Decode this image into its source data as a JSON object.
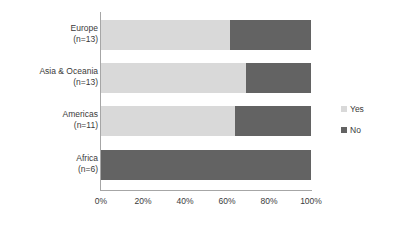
{
  "chart_data": {
    "type": "bar",
    "orientation": "horizontal",
    "stacked": true,
    "normalized": true,
    "title": "",
    "xlabel": "",
    "ylabel": "",
    "categories": [
      "Europe\n(n=13)",
      "Asia & Oceania\n(n=13)",
      "Americas\n(n=11)",
      "Africa\n(n=6)"
    ],
    "category_rows": [
      {
        "name": "Europe",
        "count_label": "(n=13)",
        "n": 13,
        "yes_pct": 61.5,
        "no_pct": 38.5
      },
      {
        "name": "Asia & Oceania",
        "count_label": "(n=13)",
        "n": 13,
        "yes_pct": 69.2,
        "no_pct": 30.8
      },
      {
        "name": "Americas",
        "count_label": "(n=11)",
        "n": 11,
        "yes_pct": 63.6,
        "no_pct": 36.4
      },
      {
        "name": "Africa",
        "count_label": "(n=6)",
        "n": 6,
        "yes_pct": 0,
        "no_pct": 100
      }
    ],
    "series": [
      {
        "name": "Yes",
        "color": "#d9d9d9",
        "values": [
          61.5,
          69.2,
          63.6,
          0
        ]
      },
      {
        "name": "No",
        "color": "#636363",
        "values": [
          38.5,
          30.8,
          36.4,
          100
        ]
      }
    ],
    "xlim": [
      0,
      100
    ],
    "xticks": [
      0,
      20,
      40,
      60,
      80,
      100
    ],
    "xtick_labels": [
      "0%",
      "20%",
      "40%",
      "60%",
      "80%",
      "100%"
    ],
    "grid": false,
    "legend": {
      "position": "right",
      "entries": [
        {
          "label": "Yes",
          "color": "#d9d9d9"
        },
        {
          "label": "No",
          "color": "#636363"
        }
      ]
    },
    "axis_color": "#a6a6a6",
    "text_color": "#3a3a3a",
    "background": "#ffffff"
  }
}
